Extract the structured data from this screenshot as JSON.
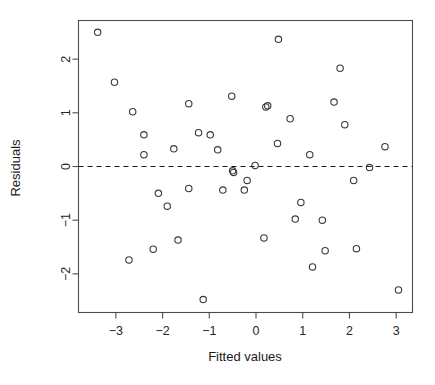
{
  "chart_data": {
    "type": "scatter",
    "title": "",
    "subtitle": "",
    "xlabel": "Fitted values",
    "ylabel": "Residuals",
    "xlim": [
      -3.8,
      3.35
    ],
    "ylim": [
      -2.72,
      2.72
    ],
    "xticks": [
      -3,
      -2,
      -1,
      0,
      1,
      2,
      3
    ],
    "yticks": [
      -2,
      -1,
      0,
      1,
      2
    ],
    "xticklabels": [
      "-3",
      "-2",
      "-1",
      "0",
      "1",
      "2",
      "3"
    ],
    "yticklabels": [
      "-2",
      "-1",
      "0",
      "1",
      "2"
    ],
    "grid": false,
    "legend": null,
    "annotations": [
      {
        "name": "zero-reference-line",
        "kind": "horizontal-dashed-line",
        "y": 0,
        "style": "dashed",
        "color": "#1a1a1a"
      }
    ],
    "marker": {
      "shape": "open-circle",
      "radius_px": 3.2,
      "edge_color": "#3a3a3a",
      "fill": "none"
    },
    "points": [
      {
        "x": -3.39,
        "y": 2.5
      },
      {
        "x": -3.03,
        "y": 1.57
      },
      {
        "x": -2.72,
        "y": -1.74
      },
      {
        "x": -2.64,
        "y": 1.02
      },
      {
        "x": -2.4,
        "y": 0.59
      },
      {
        "x": -2.4,
        "y": 0.22
      },
      {
        "x": -2.2,
        "y": -1.54
      },
      {
        "x": -2.09,
        "y": -0.5
      },
      {
        "x": -1.9,
        "y": -0.74
      },
      {
        "x": -1.76,
        "y": 0.33
      },
      {
        "x": -1.67,
        "y": -1.37
      },
      {
        "x": -1.44,
        "y": 1.17
      },
      {
        "x": -1.44,
        "y": -0.41
      },
      {
        "x": -1.23,
        "y": 0.63
      },
      {
        "x": -1.13,
        "y": -2.48
      },
      {
        "x": -0.98,
        "y": 0.59
      },
      {
        "x": -0.82,
        "y": 0.31
      },
      {
        "x": -0.71,
        "y": -0.44
      },
      {
        "x": -0.52,
        "y": 1.31
      },
      {
        "x": -0.5,
        "y": -0.08
      },
      {
        "x": -0.48,
        "y": -0.11
      },
      {
        "x": -0.25,
        "y": -0.44
      },
      {
        "x": -0.19,
        "y": -0.26
      },
      {
        "x": -0.02,
        "y": 0.02
      },
      {
        "x": 0.17,
        "y": -1.33
      },
      {
        "x": 0.21,
        "y": 1.11
      },
      {
        "x": 0.25,
        "y": 1.13
      },
      {
        "x": 0.46,
        "y": 0.43
      },
      {
        "x": 0.48,
        "y": 2.37
      },
      {
        "x": 0.73,
        "y": 0.89
      },
      {
        "x": 0.84,
        "y": -0.98
      },
      {
        "x": 0.96,
        "y": -0.67
      },
      {
        "x": 1.15,
        "y": 0.22
      },
      {
        "x": 1.21,
        "y": -1.87
      },
      {
        "x": 1.42,
        "y": -1.0
      },
      {
        "x": 1.48,
        "y": -1.57
      },
      {
        "x": 1.67,
        "y": 1.2
      },
      {
        "x": 1.8,
        "y": 1.83
      },
      {
        "x": 1.9,
        "y": 0.78
      },
      {
        "x": 2.09,
        "y": -0.26
      },
      {
        "x": 2.15,
        "y": -1.53
      },
      {
        "x": 2.43,
        "y": -0.02
      },
      {
        "x": 2.76,
        "y": 0.37
      },
      {
        "x": 3.05,
        "y": -2.3
      }
    ]
  }
}
